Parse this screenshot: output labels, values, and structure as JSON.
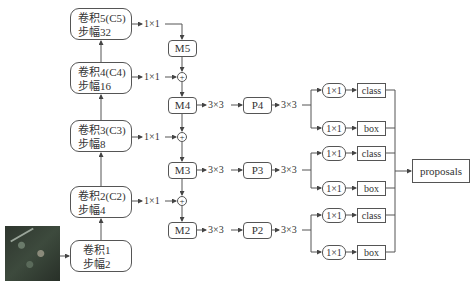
{
  "diagram": {
    "type": "FPN-RPN architecture",
    "input_image": "aerial-image-thumbnail",
    "backbone": [
      {
        "id": "C5",
        "line1": "卷积5(C5)",
        "line2": "步幅32"
      },
      {
        "id": "C4",
        "line1": "卷积4(C4)",
        "line2": "步幅16"
      },
      {
        "id": "C3",
        "line1": "卷积3(C3)",
        "line2": "步幅8"
      },
      {
        "id": "C2",
        "line1": "卷积2(C2)",
        "line2": "步幅4"
      },
      {
        "id": "C1",
        "line1": "卷积1",
        "line2": "步幅2"
      }
    ],
    "lateral_label": "1×1",
    "merge": [
      {
        "id": "M5",
        "label": "M5"
      },
      {
        "id": "M4",
        "label": "M4"
      },
      {
        "id": "M3",
        "label": "M3"
      },
      {
        "id": "M2",
        "label": "M2"
      }
    ],
    "plus_symbol": "+",
    "conv3_label": "3×3",
    "pyramid": [
      {
        "id": "P4",
        "label": "P4"
      },
      {
        "id": "P3",
        "label": "P3"
      },
      {
        "id": "P2",
        "label": "P2"
      }
    ],
    "heads": [
      {
        "conv": "1×1",
        "out": "class"
      },
      {
        "conv": "1×1",
        "out": "box"
      },
      {
        "conv": "1×1",
        "out": "class"
      },
      {
        "conv": "1×1",
        "out": "box"
      },
      {
        "conv": "1×1",
        "out": "class"
      },
      {
        "conv": "1×1",
        "out": "box"
      }
    ],
    "output": "proposals"
  }
}
